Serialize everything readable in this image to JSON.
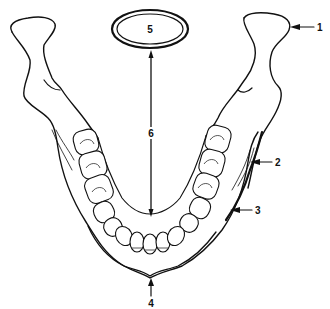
{
  "diagram": {
    "labels": [
      {
        "id": "1",
        "text": "1",
        "target": "condylar process"
      },
      {
        "id": "2",
        "text": "2",
        "target": "outer cortical border of body"
      },
      {
        "id": "3",
        "text": "3",
        "target": "mandible body outer contour"
      },
      {
        "id": "4",
        "text": "4",
        "target": "mental protuberance (chin midline)"
      },
      {
        "id": "5",
        "text": "5",
        "target": "oval outline (cross-section)"
      },
      {
        "id": "6",
        "text": "6",
        "target": "vertical distance arrow"
      }
    ],
    "colors": {
      "line": "#111111",
      "background": "#ffffff"
    }
  }
}
